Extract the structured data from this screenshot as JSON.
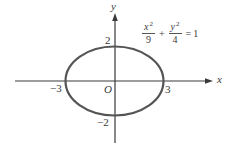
{
  "figure": {
    "type": "ellipse-plot",
    "equation": {
      "term1": {
        "numerator_var": "x",
        "numerator_exp": "2",
        "denominator": "9"
      },
      "plus": "+",
      "term2": {
        "numerator_var": "y",
        "numerator_exp": "2",
        "denominator": "4"
      },
      "equals": "=",
      "rhs": "1"
    },
    "axes": {
      "x_label": "x",
      "y_label": "y",
      "origin_label": "O"
    },
    "tick_labels": {
      "x_neg": "−3",
      "x_pos": "3",
      "y_pos": "2",
      "y_neg": "−2"
    },
    "ellipse": {
      "a": 3,
      "b": 2,
      "center": [
        0,
        0
      ]
    },
    "colors": {
      "curve": "#555555",
      "axes": "#3a3a3a",
      "text": "#3a3a3a"
    }
  }
}
